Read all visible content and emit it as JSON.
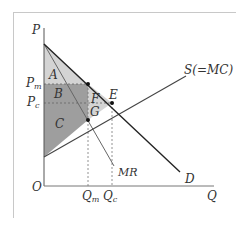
{
  "diagram": {
    "type": "monopoly-vs-competition-welfare",
    "axes": {
      "y_label": "P",
      "x_label": "Q",
      "origin_label": "O"
    },
    "curves": {
      "demand": {
        "label": "D"
      },
      "supply": {
        "label": "S(=MC)"
      },
      "marginal_revenue": {
        "label": "MR"
      }
    },
    "price_levels": [
      {
        "id": "Pm",
        "base": "P",
        "sub": "m"
      },
      {
        "id": "Pc",
        "base": "P",
        "sub": "c"
      }
    ],
    "quantity_levels": [
      {
        "id": "Qm",
        "base": "Q",
        "sub": "m"
      },
      {
        "id": "Qc",
        "base": "Q",
        "sub": "c"
      }
    ],
    "points": {
      "E": "E",
      "G": "G"
    },
    "regions": {
      "A": "A",
      "B": "B",
      "C": "C",
      "F": "F",
      "G": "G"
    },
    "colors": {
      "light_region": "#d4d4d4",
      "dark_region": "#9e9e9e",
      "line": "#333333",
      "guide": "#777777"
    }
  }
}
